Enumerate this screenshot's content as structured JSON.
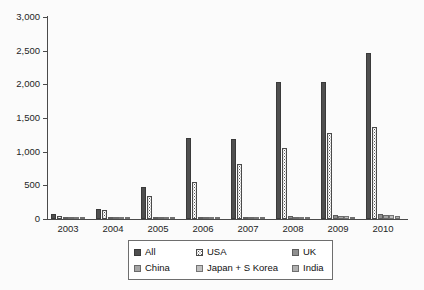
{
  "chart_data": {
    "type": "bar",
    "title": "",
    "subtitle": "",
    "xlabel": "",
    "ylabel": "",
    "categories": [
      "2003",
      "2004",
      "2005",
      "2006",
      "2007",
      "2008",
      "2009",
      "2010"
    ],
    "ylim": [
      0,
      3000
    ],
    "ytick_values": [
      0,
      500,
      1000,
      1500,
      2000,
      2500,
      3000
    ],
    "ytick_labels": [
      "0",
      "500",
      "1,000",
      "1,500",
      "2,000",
      "2,500",
      "3,000"
    ],
    "grid": false,
    "legend_position": "bottom",
    "series": [
      {
        "name": "All",
        "swatch": "dark-gray-solid",
        "color": "#4f4f4f",
        "values": [
          80,
          145,
          470,
          1200,
          1195,
          2035,
          2030,
          2460
        ]
      },
      {
        "name": "USA",
        "swatch": "white-dotted",
        "color": "#ffffff",
        "values": [
          50,
          140,
          345,
          550,
          810,
          1060,
          1280,
          1370
        ]
      },
      {
        "name": "UK",
        "swatch": "medium-gray",
        "color": "#8f8f8f",
        "values": [
          10,
          8,
          12,
          30,
          30,
          45,
          60,
          70
        ]
      },
      {
        "name": "China",
        "swatch": "gray",
        "color": "#a5a5a5",
        "values": [
          3,
          4,
          8,
          12,
          18,
          28,
          40,
          55
        ]
      },
      {
        "name": "Japan + S Korea",
        "swatch": "light-gray",
        "color": "#c0c0c0",
        "values": [
          2,
          3,
          6,
          10,
          14,
          22,
          48,
          60
        ]
      },
      {
        "name": "India",
        "swatch": "light-medium-gray",
        "color": "#b0b0b0",
        "values": [
          2,
          3,
          5,
          9,
          12,
          20,
          30,
          38
        ]
      }
    ]
  },
  "legend": {
    "entries": [
      {
        "label": "All"
      },
      {
        "label": "USA"
      },
      {
        "label": "UK"
      },
      {
        "label": "China"
      },
      {
        "label": "Japan + S Korea"
      },
      {
        "label": "India"
      }
    ]
  }
}
